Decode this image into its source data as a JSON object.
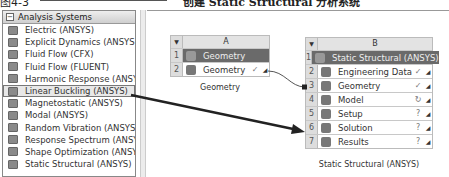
{
  "top_caption": {
    "prefix": "图4-3",
    "text": "创建 Static Structural 分析系统"
  },
  "toolbox": {
    "header": "Analysis Systems",
    "items": [
      {
        "label": "Electric (ANSYS)",
        "icon": "electric-icon"
      },
      {
        "label": "Explicit Dynamics (ANSYS)",
        "icon": "explicit-dynamics-icon"
      },
      {
        "label": "Fluid Flow (CFX)",
        "icon": "fluid-flow-cfx-icon"
      },
      {
        "label": "Fluid Flow (FLUENT)",
        "icon": "fluid-flow-fluent-icon"
      },
      {
        "label": "Harmonic Response (ANSYS)",
        "icon": "harmonic-response-icon"
      },
      {
        "label": "Linear Buckling (ANSYS)",
        "icon": "linear-buckling-icon",
        "selected": true
      },
      {
        "label": "Magnetostatic (ANSYS)",
        "icon": "magnetostatic-icon"
      },
      {
        "label": "Modal (ANSYS)",
        "icon": "modal-icon"
      },
      {
        "label": "Random Vibration (ANSYS)",
        "icon": "random-vibration-icon"
      },
      {
        "label": "Response Spectrum (ANSYS)",
        "icon": "response-spectrum-icon"
      },
      {
        "label": "Shape Optimization (ANSYS)",
        "icon": "shape-optimization-icon"
      },
      {
        "label": "Static Structural (ANSYS)",
        "icon": "static-structural-icon"
      }
    ]
  },
  "system_a": {
    "column": "A",
    "rows": [
      {
        "num": "1",
        "label": "Geometry",
        "status": ""
      },
      {
        "num": "2",
        "label": "Geometry",
        "status": "✓"
      }
    ],
    "caption": "Geometry"
  },
  "system_b": {
    "column": "B",
    "rows": [
      {
        "num": "1",
        "label": "Static Structural (ANSYS)",
        "status": ""
      },
      {
        "num": "2",
        "label": "Engineering Data",
        "status": "✓"
      },
      {
        "num": "3",
        "label": "Geometry",
        "status": "✓"
      },
      {
        "num": "4",
        "label": "Model",
        "status": "↻"
      },
      {
        "num": "5",
        "label": "Setup",
        "status": "?"
      },
      {
        "num": "6",
        "label": "Solution",
        "status": "?"
      },
      {
        "num": "7",
        "label": "Results",
        "status": "?"
      }
    ],
    "caption": "Static Structural (ANSYS)"
  }
}
